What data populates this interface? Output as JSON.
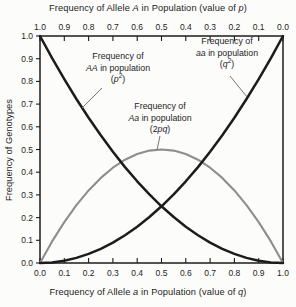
{
  "chart_data": {
    "type": "line",
    "grid": false,
    "legend_position": "none",
    "axis_color": "#1c1c1c",
    "text_color": "#1c1c1c",
    "x_range": [
      0,
      1
    ],
    "y_range": [
      0,
      1
    ],
    "x_axis_top": {
      "title_parts": {
        "pre": "Frequency of Allele ",
        "var1": "A",
        "mid": " in Population (value of ",
        "var2": "p",
        "post": ")"
      },
      "ticks": [
        "1.0",
        "0.9",
        "0.8",
        "0.7",
        "0.6",
        "0.5",
        "0.4",
        "0.3",
        "0.2",
        "0.1",
        "0.0"
      ]
    },
    "x_axis_bottom": {
      "title_parts": {
        "pre": "Frequency of Allele ",
        "var1": "a",
        "mid": " in Population (value of ",
        "var2": "q",
        "post": ")"
      },
      "ticks": [
        "0.0",
        "0.1",
        "0.2",
        "0.3",
        "0.4",
        "0.5",
        "0.6",
        "0.7",
        "0.8",
        "0.9",
        "1.0"
      ]
    },
    "y_axis": {
      "title": "Frequency of Genotypes",
      "ticks_top_to_bottom": [
        "1.0",
        "0.9",
        "0.8",
        "0.7",
        "0.6",
        "0.5",
        "0.4",
        "0.3",
        "0.2",
        "0.1",
        "0.0"
      ]
    },
    "x": [
      0,
      0.05,
      0.1,
      0.15,
      0.2,
      0.25,
      0.3,
      0.35,
      0.4,
      0.45,
      0.5,
      0.55,
      0.6,
      0.65,
      0.7,
      0.75,
      0.8,
      0.85,
      0.9,
      0.95,
      1
    ],
    "series": [
      {
        "id": "Aa",
        "name": "Frequency of Aa in population (2pq)",
        "formula": "2pq",
        "color": "#8e8e8e",
        "stroke_width": 2.1,
        "values": [
          0,
          0.095,
          0.18,
          0.255,
          0.32,
          0.375,
          0.42,
          0.455,
          0.48,
          0.495,
          0.5,
          0.495,
          0.48,
          0.455,
          0.42,
          0.375,
          0.32,
          0.255,
          0.18,
          0.095,
          0
        ]
      },
      {
        "id": "AA",
        "name": "Frequency of AA in population (p²)",
        "formula": "p²",
        "color": "#1c1c1c",
        "stroke_width": 2.5,
        "values": [
          1,
          0.9025,
          0.81,
          0.7225,
          0.64,
          0.5625,
          0.49,
          0.4225,
          0.36,
          0.3025,
          0.25,
          0.2025,
          0.16,
          0.1225,
          0.09,
          0.0625,
          0.04,
          0.0225,
          0.01,
          0.0025,
          0
        ]
      },
      {
        "id": "aa",
        "name": "Frequency of aa in population (q²)",
        "formula": "q²",
        "color": "#1c1c1c",
        "stroke_width": 2.5,
        "values": [
          0,
          0.0025,
          0.01,
          0.0225,
          0.04,
          0.0625,
          0.09,
          0.1225,
          0.16,
          0.2025,
          0.25,
          0.3025,
          0.36,
          0.4225,
          0.49,
          0.5625,
          0.64,
          0.7225,
          0.81,
          0.9025,
          1
        ]
      }
    ]
  },
  "annotations": {
    "AA": {
      "line1": "Frequency of",
      "var": "AA",
      "line2_rest": " in population",
      "paren_open": "(",
      "symbol": "p",
      "sup": "2",
      "paren_close": ")"
    },
    "aa": {
      "line1": "Frequency of",
      "var": "aa",
      "line2_rest": " in population",
      "paren_open": "(",
      "symbol": "q",
      "sup": "2",
      "paren_close": ")"
    },
    "Aa": {
      "line1": "Frequency of",
      "var": "Aa",
      "line2_rest": " in population",
      "paren_open": "(2",
      "symbol": "pq",
      "paren_close": ")"
    }
  }
}
